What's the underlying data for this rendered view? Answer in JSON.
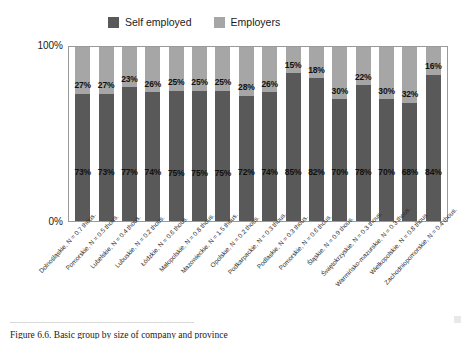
{
  "chart_data": {
    "type": "bar",
    "subtype": "stacked-100-percent",
    "title": "",
    "xlabel": "",
    "ylabel": "",
    "ylim": [
      0,
      100
    ],
    "ytick_labels": [
      "100%",
      "0%"
    ],
    "grid": false,
    "legend_position": "top-center",
    "orientation": "vertical",
    "categories": [
      "Dolnośląskie, N = 0.7 thous.",
      "Pomorskie, N = 0.5 thous.",
      "Lubelskie, N = 0.4 thous.",
      "Lubuskie, N = 0.2 thous.",
      "Łódzkie, N = 0.6 thous.",
      "Małopolskie, N = 0.8 thous.",
      "Mazowieckie, N = 1.5 thous.",
      "Opolskie, N = 0.2 thous.",
      "Podkarpackie, N = 0.3 thous.",
      "Podlaskie, N = 0.3 thous.",
      "Pomorskie, N = 0.6 thous.",
      "Śląskie, N = 0.9 thous.",
      "Świętokrzyskie, N = 0.3 thous.",
      "Warmińsko-mazurskie, N = 0.3 thous.",
      "Wielkopolskie, N = 0.8 thous.",
      "Zachodniopomorskie, N = 0.4 thous."
    ],
    "series": [
      {
        "name": "Self employed",
        "color": "#595959",
        "stack_position": "bottom",
        "values": [
          73,
          73,
          77,
          74,
          75,
          75,
          75,
          72,
          74,
          85,
          82,
          70,
          78,
          70,
          68,
          84
        ],
        "value_labels": [
          "73%",
          "73%",
          "77%",
          "74%",
          "75%",
          "75%",
          "75%",
          "72%",
          "74%",
          "85%",
          "82%",
          "70%",
          "78%",
          "70%",
          "68%",
          "84%"
        ]
      },
      {
        "name": "Employers",
        "color": "#a6a6a6",
        "stack_position": "top",
        "values": [
          27,
          27,
          23,
          26,
          25,
          25,
          25,
          28,
          26,
          15,
          18,
          30,
          22,
          30,
          32,
          16
        ],
        "value_labels": [
          "27%",
          "27%",
          "23%",
          "26%",
          "25%",
          "25%",
          "25%",
          "28%",
          "26%",
          "15%",
          "18%",
          "30%",
          "22%",
          "30%",
          "32%",
          "16%"
        ]
      }
    ]
  },
  "legend": {
    "items": [
      {
        "label": "Self employed",
        "color": "#595959"
      },
      {
        "label": "Employers",
        "color": "#a6a6a6"
      }
    ]
  },
  "axis": {
    "y_top": "100%",
    "y_bottom": "0%"
  },
  "caption": {
    "text": "Figure 6.6. Basic group by size of company and province"
  }
}
